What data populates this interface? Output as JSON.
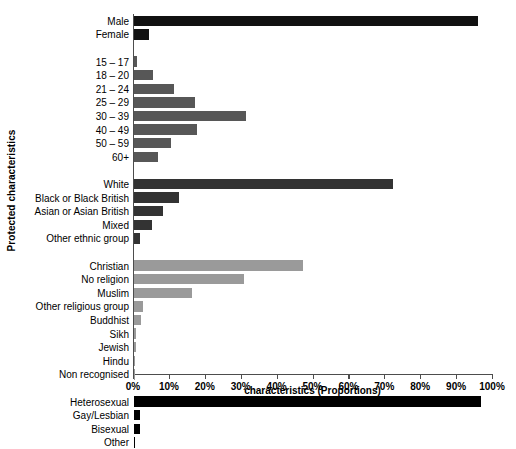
{
  "chart_data": {
    "type": "bar",
    "orientation": "horizontal",
    "title": "",
    "xlabel": "characteristics (Proportions)",
    "ylabel": "Protected characteristics",
    "xlim": [
      0,
      100
    ],
    "xtick_labels": [
      "0%",
      "10%",
      "20%",
      "30%",
      "40%",
      "50%",
      "60%",
      "70%",
      "80%",
      "90%",
      "100%"
    ],
    "xtick_values": [
      0,
      10,
      20,
      30,
      40,
      50,
      60,
      70,
      80,
      90,
      100
    ],
    "grid": false,
    "legend": "none",
    "units": "percent",
    "groups": [
      {
        "name": "sex",
        "color": "#111111",
        "categories": [
          "Male",
          "Female"
        ],
        "values": [
          95.8,
          4.2
        ]
      },
      {
        "name": "age",
        "color": "#575757",
        "categories": [
          "15 – 17",
          "18 – 20",
          "21 – 24",
          "25 – 29",
          "30 – 39",
          "40 – 49",
          "50 – 59",
          "60+"
        ],
        "values": [
          0.6,
          5.1,
          11.0,
          16.9,
          31.2,
          17.5,
          10.1,
          6.5
        ]
      },
      {
        "name": "ethnicity",
        "color": "#333333",
        "categories": [
          "White",
          "Black or Black British",
          "Asian or Asian British",
          "Mixed",
          "Other ethnic group"
        ],
        "values": [
          72.1,
          12.4,
          8.0,
          5.0,
          1.6
        ]
      },
      {
        "name": "religion",
        "color": "#9a9a9a",
        "categories": [
          "Christian",
          "No religion",
          "Muslim",
          "Other religious group",
          "Buddhist",
          "Sikh",
          "Jewish",
          "Hindu",
          "Non recognised"
        ],
        "values": [
          47.0,
          30.4,
          16.1,
          2.3,
          1.9,
          0.5,
          0.5,
          0.3,
          0.2
        ]
      },
      {
        "name": "sexuality",
        "color": "#000000",
        "categories": [
          "Heterosexual",
          "Gay/Lesbian",
          "Bisexual",
          "Other"
        ],
        "values": [
          96.5,
          1.5,
          1.5,
          0.2
        ]
      }
    ]
  }
}
